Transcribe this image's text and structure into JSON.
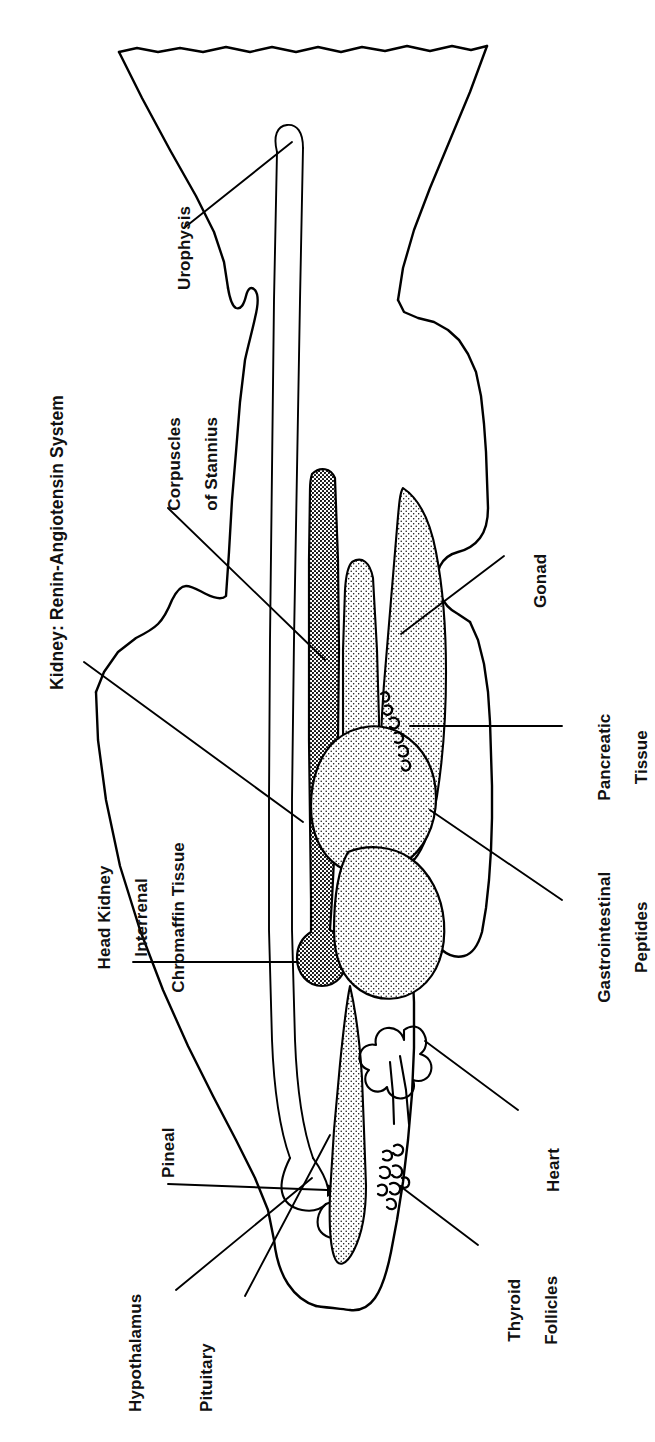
{
  "figure": {
    "title": "Kidney: Renin-Angiotensin System",
    "orientation": "rotated 90 degrees counter-clockwise; fish head at bottom, tail at top",
    "ink_color": "#000000",
    "background_color": "#ffffff"
  },
  "labels": {
    "kidney": "Kidney: Renin-Angiotensin System",
    "urophysis": "Urophysis",
    "corpuscles_line1": "Corpuscles",
    "corpuscles_line2": "of Stannius",
    "head_kidney_line1": "Head Kidney",
    "head_kidney_line2": "Interrenal",
    "head_kidney_line3": "Chromaffin Tissue",
    "pineal": "Pineal",
    "hypothalamus": "Hypothalamus",
    "pituitary": "Pituitary",
    "gonad": "Gonad",
    "pancreatic_line1": "Pancreatic",
    "pancreatic_line2": "Tissue",
    "gastrointestinal_line1": "Gastrointestinal",
    "gastrointestinal_line2": "Peptides",
    "heart": "Heart",
    "thyroid_line1": "Thyroid",
    "thyroid_line2": "Follicles"
  },
  "organs": [
    {
      "name": "kidney",
      "label": "Kidney: Renin-Angiotensin System",
      "fill": "dark-stipple",
      "side": "left"
    },
    {
      "name": "head-kidney",
      "label": "Head Kidney Interrenal Chromaffin Tissue",
      "fill": "dark-stipple",
      "side": "left"
    },
    {
      "name": "corpuscles-of-stannius",
      "label": "Corpuscles of Stannius",
      "fill": "dark-stipple",
      "side": "left"
    },
    {
      "name": "urophysis",
      "label": "Urophysis",
      "fill": "outline",
      "side": "left"
    },
    {
      "name": "pineal",
      "label": "Pineal",
      "fill": "solid-black",
      "side": "left"
    },
    {
      "name": "hypothalamus",
      "label": "Hypothalamus",
      "fill": "outline",
      "side": "left"
    },
    {
      "name": "pituitary",
      "label": "Pituitary",
      "fill": "outline",
      "side": "left"
    },
    {
      "name": "gonad",
      "label": "Gonad",
      "fill": "light-stipple",
      "side": "right"
    },
    {
      "name": "pancreatic-tissue",
      "label": "Pancreatic Tissue",
      "fill": "squiggle",
      "side": "right"
    },
    {
      "name": "gastrointestinal-peptides",
      "label": "Gastrointestinal Peptides",
      "fill": "light-stipple",
      "side": "right"
    },
    {
      "name": "heart",
      "label": "Heart",
      "fill": "outline",
      "side": "right"
    },
    {
      "name": "thyroid-follicles",
      "label": "Thyroid Follicles",
      "fill": "squiggle",
      "side": "right"
    }
  ]
}
